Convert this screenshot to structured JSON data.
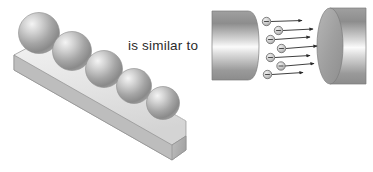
{
  "figure": {
    "background_color": "#ffffff",
    "width": 373,
    "height": 172
  },
  "connector": {
    "text": "is similar to",
    "color": "#2b2b2b"
  },
  "left_panel": {
    "name": "inclined-beam-with-spheres",
    "beam": {
      "label": "inclined rectangular beam",
      "top_face_color": "#e8e8e8",
      "front_face_color": "#c9c9c9",
      "end_face_color": "#b4b4b4",
      "outline_color": "#8a8a8a"
    },
    "spheres": {
      "count": 5,
      "label": "sphere",
      "base_color": "#9a9a9a",
      "highlight_color": "#f2f2f2",
      "shadow_color": "#6e6e6e",
      "items": [
        {
          "cx": 39,
          "cy": 33,
          "r": 20.5
        },
        {
          "cx": 72,
          "cy": 51,
          "r": 19.5
        },
        {
          "cx": 104,
          "cy": 69,
          "r": 18.5
        },
        {
          "cx": 134,
          "cy": 86,
          "r": 17.5
        },
        {
          "cx": 163,
          "cy": 103,
          "r": 16.5
        }
      ]
    }
  },
  "right_panel": {
    "name": "electron-flow-between-cylinders",
    "left_cylinder": {
      "label": "left conductor cylinder",
      "body_color_dark": "#8e8e8e",
      "body_color_light": "#f6f6f6",
      "outline_color": "#7d7d7d"
    },
    "right_cylinder": {
      "label": "right conductor cylinder",
      "face_color": "#9d9d9d",
      "body_color_dark": "#8e8e8e",
      "body_color_light": "#f7f7f7",
      "outline_color": "#7d7d7d"
    },
    "electrons": {
      "count": 7,
      "label": "electron",
      "symbol": "−",
      "fill_color": "#cfcfcf",
      "stroke_color": "#6a6a6a",
      "radius": 4.2,
      "items": [
        {
          "cx": 266.5,
          "cy": 21.5,
          "arrow_to_x": 302,
          "arrow_to_y": 20.5
        },
        {
          "cx": 278.5,
          "cy": 30.5,
          "arrow_to_x": 313,
          "arrow_to_y": 29.0
        },
        {
          "cx": 270.5,
          "cy": 39.5,
          "arrow_to_x": 310,
          "arrow_to_y": 37.0
        },
        {
          "cx": 281.5,
          "cy": 48.5,
          "arrow_to_x": 317,
          "arrow_to_y": 46.0
        },
        {
          "cx": 270.5,
          "cy": 57.5,
          "arrow_to_x": 310,
          "arrow_to_y": 55.5
        },
        {
          "cx": 281.0,
          "cy": 66.0,
          "arrow_to_x": 314,
          "arrow_to_y": 63.5
        },
        {
          "cx": 267.5,
          "cy": 74.5,
          "arrow_to_x": 303,
          "arrow_to_y": 72.5
        }
      ]
    },
    "arrows": {
      "label": "flow arrow",
      "color": "#2a2a2a",
      "count": 7,
      "direction": "left-to-right"
    }
  }
}
